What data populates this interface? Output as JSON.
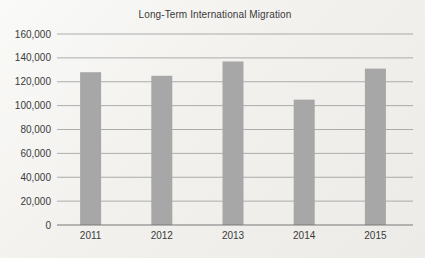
{
  "page": {
    "background": "#f2f1ee"
  },
  "chart_data": {
    "type": "bar",
    "title": "Long-Term International Migration",
    "categories": [
      "2011",
      "2012",
      "2013",
      "2014",
      "2015"
    ],
    "values": [
      128000,
      125000,
      137000,
      105000,
      131000
    ],
    "xlabel": "",
    "ylabel": "",
    "ylim": [
      0,
      160000
    ],
    "ytick_step": 20000,
    "ytick_labels": [
      "0",
      "20,000",
      "40,000",
      "60,000",
      "80,000",
      "100,000",
      "120,000",
      "140,000",
      "160,000"
    ],
    "grid": true,
    "legend": "none",
    "bar_color": "#a7a7a7",
    "gridline_color": "#9a9a9a",
    "axis_color": "#787878",
    "text_color": "#3a3a3a"
  }
}
